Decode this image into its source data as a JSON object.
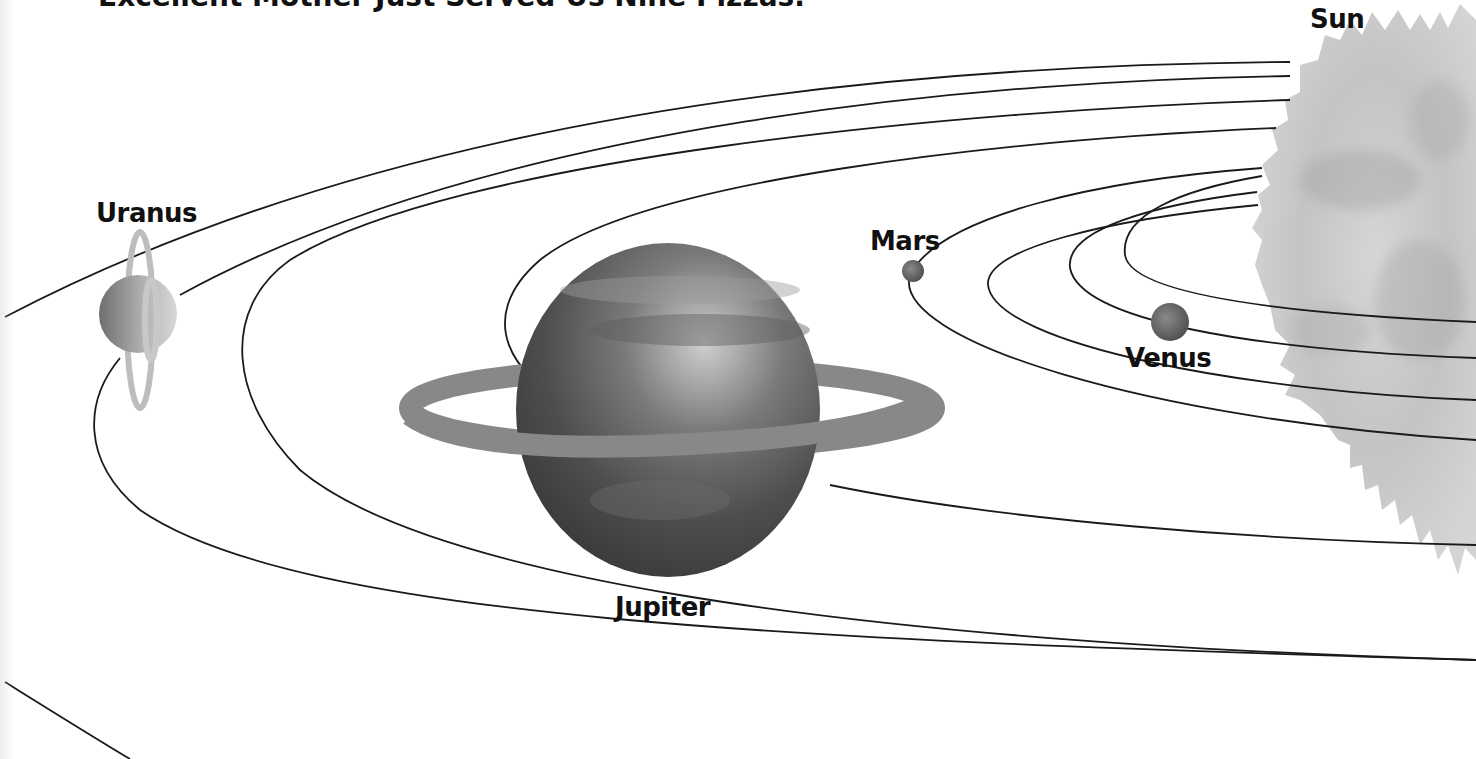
{
  "header": {
    "mnemonic": "Excellent Mother Just Served Us Nine Pizzas."
  },
  "labels": {
    "sun": "Sun",
    "uranus": "Uranus",
    "mars": "Mars",
    "venus": "Venus",
    "jupiter": "Jupiter"
  },
  "diagram": {
    "type": "solar-system-orbits",
    "orbit_count": 8,
    "labeled_bodies": [
      "Sun",
      "Venus",
      "Mars",
      "Jupiter",
      "Uranus"
    ],
    "colors": {
      "background": "#ffffff",
      "orbit_line": "#1a1a1a",
      "sun": "#c9c9c9",
      "jupiter": "#4a4a4a",
      "jupiter_ring": "#8a8a8a",
      "uranus": "#9a9a9a",
      "mars": "#6a6a6a",
      "venus": "#7a7a7a",
      "text": "#111111"
    }
  }
}
